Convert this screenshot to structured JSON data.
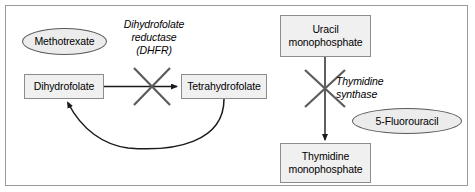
{
  "figure": {
    "border_color": "#9a9a9a",
    "background": "#ffffff"
  },
  "style": {
    "box_fill": "#f0f0f0",
    "box_stroke": "#8c8c8c",
    "ellipse_fill": "#ececec",
    "ellipse_stroke": "#5a5a5a",
    "arrow_color": "#1a1a1a",
    "inhibition_color": "#5c5c5c"
  },
  "left_pathway": {
    "drug": {
      "label": "Methotrexate",
      "shape": "ellipse"
    },
    "substrate": {
      "label": "Dihydrofolate",
      "shape": "box"
    },
    "product": {
      "label": "Tetrahydrofolate",
      "shape": "box"
    },
    "enzyme": {
      "label": "Dihydrofolate\nreductase\n(DHFR)",
      "style": "italic"
    },
    "inhibition": {
      "symbol": "x-cross",
      "target": "dihydrofolate-to-tetrahydrofolate-arrow"
    },
    "recycle_arrow": {
      "from": "Tetrahydrofolate",
      "to": "Dihydrofolate",
      "style": "curved"
    }
  },
  "right_pathway": {
    "drug": {
      "label": "5-Fluorouracil",
      "shape": "ellipse"
    },
    "substrate": {
      "label": "Uracil\nmonophosphate",
      "shape": "box"
    },
    "product": {
      "label": "Thymidine\nmonophosphate",
      "shape": "box"
    },
    "enzyme": {
      "label": "Thymidine\nsynthase",
      "style": "italic"
    },
    "inhibition": {
      "symbol": "x-cross",
      "target": "uracil-to-thymidine-arrow"
    }
  }
}
